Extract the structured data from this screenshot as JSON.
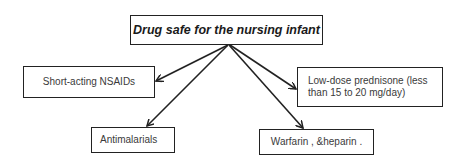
{
  "diagram": {
    "root": {
      "id": "root",
      "label": "Drug safe for the nursing infant"
    },
    "children": [
      {
        "id": "nsaids",
        "label": "Short-acting NSAIDs"
      },
      {
        "id": "prednisone",
        "label": "Low-dose prednisone (less than 15 to 20 mg/day)"
      },
      {
        "id": "antimalarials",
        "label": "Antimalarials"
      },
      {
        "id": "warfarin",
        "label": "Warfarin , &heparin ."
      }
    ],
    "edges": [
      {
        "from": "root",
        "to": "nsaids"
      },
      {
        "from": "root",
        "to": "prednisone"
      },
      {
        "from": "root",
        "to": "antimalarials"
      },
      {
        "from": "root",
        "to": "warfarin"
      }
    ],
    "colors": {
      "stroke": "#222222",
      "text": "#3a3a3a",
      "background": "#ffffff"
    }
  }
}
